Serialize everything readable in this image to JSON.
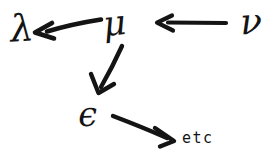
{
  "figure": {
    "kind": "hand-drawn-arrow-diagram",
    "background_color": "#ffffff",
    "ink_color": "#141414",
    "width": 277,
    "height": 157,
    "nodes": [
      {
        "id": "lambda",
        "label": "λ",
        "name": "lambda"
      },
      {
        "id": "mu",
        "label": "μ",
        "name": "mu"
      },
      {
        "id": "nu",
        "label": "ν",
        "name": "nu"
      },
      {
        "id": "epsilon",
        "label": "ϵ",
        "name": "epsilon"
      },
      {
        "id": "etc",
        "label": "etc",
        "name": "etc"
      }
    ],
    "edges": [
      {
        "from": "nu",
        "to": "mu",
        "direction": "leftward",
        "name": "nu-to-mu"
      },
      {
        "from": "mu",
        "to": "lambda",
        "direction": "leftward",
        "name": "mu-to-lambda"
      },
      {
        "from": "mu",
        "to": "epsilon",
        "direction": "down-left",
        "name": "mu-to-epsilon"
      },
      {
        "from": "epsilon",
        "to": "etc",
        "direction": "down-right",
        "name": "epsilon-to-etc"
      }
    ]
  }
}
